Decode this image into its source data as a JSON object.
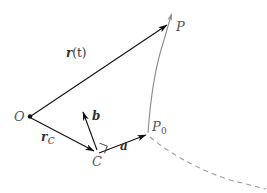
{
  "figure": {
    "background_color": "#ffffff",
    "width": 267,
    "height": 193
  },
  "colors": {
    "vector_black": "#111111",
    "curve_grey": "#8a8a92",
    "dashed_grey": "#9a9aa2",
    "label_grey": "#555555",
    "label_dark": "#333333"
  },
  "points": [
    {
      "id": "O",
      "label": "O",
      "sub": "",
      "x": 29,
      "y": 117,
      "label_x": 14,
      "label_y": 118,
      "dot": true
    },
    {
      "id": "C",
      "label": "C",
      "sub": "",
      "x": 96,
      "y": 153,
      "label_x": 92,
      "label_y": 161,
      "dot": false
    },
    {
      "id": "P0",
      "label": "P",
      "sub": "0",
      "x": 148,
      "y": 133,
      "label_x": 152,
      "label_y": 126,
      "dot": false
    },
    {
      "id": "P",
      "label": "P",
      "sub": "",
      "x": 171,
      "y": 22,
      "label_x": 176,
      "label_y": 26,
      "dot": false
    }
  ],
  "vectors": [
    {
      "id": "r_of_t",
      "label": "r",
      "label_suffix": "(t)",
      "label_sub": "",
      "from": "O",
      "to": "P",
      "label_x": 66,
      "label_y": 53,
      "color": "#111111"
    },
    {
      "id": "r_C",
      "label": "r",
      "label_suffix": "",
      "label_sub": "C",
      "from": "O",
      "to": "C",
      "label_x": 41,
      "label_y": 137,
      "color": "#111111"
    },
    {
      "id": "a",
      "label": "a",
      "label_suffix": "",
      "label_sub": "",
      "from": "C",
      "to": "P0",
      "label_x": 120,
      "label_y": 146,
      "color": "#111111"
    },
    {
      "id": "b",
      "label": "b",
      "label_suffix": "",
      "label_sub": "",
      "from": "C",
      "to": "b_tip",
      "label_x": 92,
      "label_y": 116,
      "color": "#111111"
    }
  ],
  "curves": [
    {
      "id": "trajectory-solid",
      "style": "solid",
      "color": "#8a8a92",
      "arrowhead": true,
      "description": "grey curve from P0 upward through P with arrowhead"
    },
    {
      "id": "trajectory-dashed",
      "style": "dashed",
      "color": "#9a9aa2",
      "arrowhead": false,
      "description": "grey dashed curve continuing from P0 down to lower right"
    }
  ],
  "markers": [
    {
      "id": "right-angle-at-C",
      "type": "right-angle-square",
      "at": "C",
      "description": "small square denoting a and b are perpendicular"
    }
  ]
}
